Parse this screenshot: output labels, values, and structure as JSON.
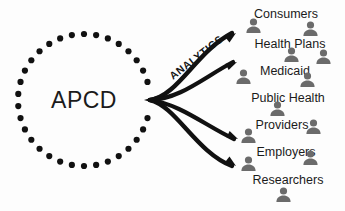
{
  "diagram": {
    "title_text": "APCD",
    "flow_label": "ANALYTICS",
    "colors": {
      "dot": "#111111",
      "arrow": "#111111",
      "person": "#6b6b6b",
      "text": "#1b1b1b",
      "background": "#fdfdfd"
    },
    "source": {
      "label": "APCD",
      "center_x": 84,
      "center_y": 100,
      "radius": 66,
      "dot_count": 34,
      "dot_radius": 3.1
    },
    "flow": {
      "label": "ANALYTICS",
      "rotation_deg": -38,
      "x": 196,
      "y": 57,
      "arrow_count": 4,
      "origin_x": 150,
      "origin_y": 100
    },
    "audiences": [
      {
        "label": "Consumers",
        "x": 286,
        "y": 14
      },
      {
        "label": "Health Plans",
        "x": 290,
        "y": 44
      },
      {
        "label": "Medicaid",
        "x": 285,
        "y": 71
      },
      {
        "label": "Public Health",
        "x": 288,
        "y": 98
      },
      {
        "label": "Providers",
        "x": 282,
        "y": 125
      },
      {
        "label": "Employers",
        "x": 286,
        "y": 152
      },
      {
        "label": "Researchers",
        "x": 288,
        "y": 180
      }
    ],
    "person_icons": [
      {
        "x": 253,
        "y": 25,
        "scale": 1.0
      },
      {
        "x": 310,
        "y": 28,
        "scale": 1.0
      },
      {
        "x": 291,
        "y": 54,
        "scale": 1.0
      },
      {
        "x": 323,
        "y": 56,
        "scale": 1.0
      },
      {
        "x": 243,
        "y": 76,
        "scale": 1.0
      },
      {
        "x": 307,
        "y": 79,
        "scale": 1.0
      },
      {
        "x": 277,
        "y": 108,
        "scale": 1.0
      },
      {
        "x": 313,
        "y": 126,
        "scale": 1.0
      },
      {
        "x": 248,
        "y": 135,
        "scale": 1.0
      },
      {
        "x": 310,
        "y": 157,
        "scale": 1.0
      },
      {
        "x": 248,
        "y": 163,
        "scale": 1.0
      },
      {
        "x": 283,
        "y": 194,
        "scale": 1.0
      }
    ]
  }
}
